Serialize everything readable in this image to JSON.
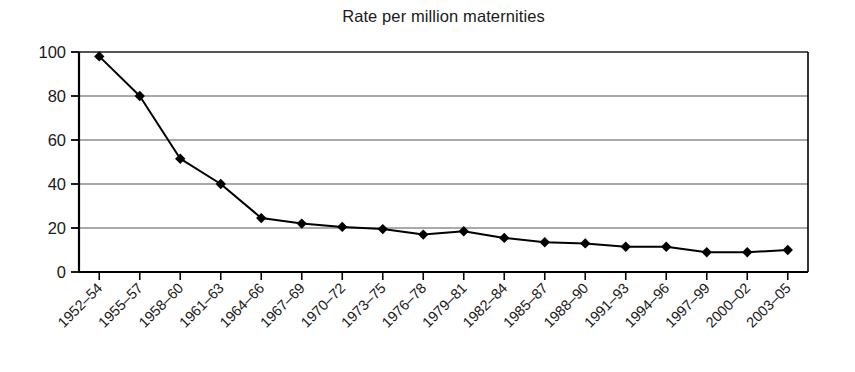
{
  "chart_data": {
    "type": "line",
    "title": "Rate per million maternities",
    "xlabel": "",
    "ylabel": "",
    "categories": [
      "1952–54",
      "1955–57",
      "1958–60",
      "1961–63",
      "1964–66",
      "1967–69",
      "1970–72",
      "1973–75",
      "1976–78",
      "1979–81",
      "1982–84",
      "1985–87",
      "1988–90",
      "1991–93",
      "1994–96",
      "1997–99",
      "2000–02",
      "2003–05"
    ],
    "values": [
      98,
      80,
      51.5,
      40,
      24.5,
      22,
      20.5,
      19.5,
      17,
      18.5,
      15.5,
      13.5,
      13,
      11.5,
      11.5,
      9,
      9,
      10
    ],
    "series": [
      {
        "name": "Rate per million maternities",
        "values": [
          98,
          80,
          51.5,
          40,
          24.5,
          22,
          20.5,
          19.5,
          17,
          18.5,
          15.5,
          13.5,
          13,
          11.5,
          11.5,
          9,
          9,
          10
        ]
      }
    ],
    "ylim": [
      0,
      100
    ],
    "yticks": [
      0,
      20,
      40,
      60,
      80,
      100
    ],
    "ytick_labels": [
      "0",
      "20",
      "40",
      "60",
      "80",
      "100"
    ],
    "grid": "horizontal",
    "legend": "none",
    "marker": "diamond",
    "line_color": "#000000",
    "marker_color": "#000000",
    "grid_color": "#555555",
    "axis_color": "#000000",
    "xtick_label_rotation": 45
  },
  "edge": {
    "fragment": ""
  }
}
